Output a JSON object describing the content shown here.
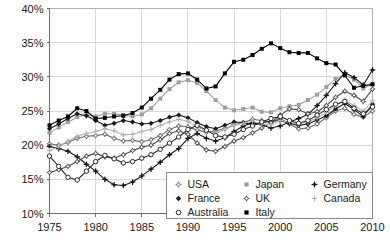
{
  "chart_data": {
    "type": "line",
    "title": "",
    "xlabel": "",
    "ylabel": "",
    "xlim": [
      1975,
      2010
    ],
    "ylim": [
      10,
      40
    ],
    "grid": true,
    "legend_position": "bottom-right",
    "x_ticks": [
      "1975",
      "1980",
      "1985",
      "1990",
      "1995",
      "2000",
      "2005",
      "2010"
    ],
    "x_tick_values": [
      1975,
      1980,
      1985,
      1990,
      1995,
      2000,
      2005,
      2010
    ],
    "y_ticks": [
      "10%",
      "15%",
      "20%",
      "25%",
      "30%",
      "35%",
      "40%"
    ],
    "y_tick_values": [
      10,
      15,
      20,
      25,
      30,
      35,
      40
    ],
    "x": [
      1975,
      1976,
      1977,
      1978,
      1979,
      1980,
      1981,
      1982,
      1983,
      1984,
      1985,
      1986,
      1987,
      1988,
      1989,
      1990,
      1991,
      1992,
      1993,
      1994,
      1995,
      1996,
      1997,
      1998,
      1999,
      2000,
      2001,
      2002,
      2003,
      2004,
      2005,
      2006,
      2007,
      2008,
      2009,
      2010
    ],
    "series": [
      {
        "name": "USA",
        "color": "#6b6b6b",
        "marker": "open-star",
        "values": [
          20.2,
          20.0,
          20.4,
          21.0,
          21.3,
          21.4,
          21.6,
          21.0,
          20.6,
          20.7,
          20.5,
          20.8,
          21.4,
          22.3,
          22.8,
          22.7,
          22.2,
          21.9,
          22.1,
          22.4,
          23.0,
          23.3,
          23.8,
          23.6,
          23.4,
          23.9,
          23.1,
          22.4,
          22.5,
          23.1,
          24.0,
          25.0,
          25.4,
          24.5,
          24.1,
          25.0
        ]
      },
      {
        "name": "Japan",
        "color": "#9e9e9e",
        "marker": "filled-square",
        "values": [
          21.8,
          22.6,
          23.4,
          24.1,
          24.5,
          24.2,
          24.6,
          24.6,
          24.4,
          24.2,
          24.5,
          25.4,
          26.8,
          28.2,
          29.2,
          29.5,
          29.1,
          27.9,
          26.6,
          25.5,
          25.1,
          25.3,
          25.5,
          24.9,
          24.8,
          25.4,
          25.7,
          25.9,
          26.6,
          27.4,
          28.5,
          29.7,
          30.3,
          29.6,
          28.3,
          29.0
        ]
      },
      {
        "name": "Germany",
        "color": "#1a1a1a",
        "marker": "filled-star",
        "values": [
          19.8,
          19.5,
          19.1,
          18.3,
          17.2,
          16.2,
          15.0,
          14.2,
          14.1,
          14.6,
          15.5,
          16.5,
          17.5,
          18.6,
          19.5,
          21.0,
          21.7,
          21.0,
          20.6,
          21.1,
          22.0,
          22.8,
          23.3,
          23.0,
          22.5,
          22.8,
          23.4,
          23.9,
          24.5,
          25.8,
          27.3,
          29.0,
          30.6,
          29.9,
          28.8,
          31.0
        ]
      },
      {
        "name": "France",
        "color": "#1a1a1a",
        "marker": "filled-diamond",
        "values": [
          22.4,
          23.1,
          23.9,
          24.6,
          24.3,
          23.6,
          22.9,
          23.2,
          23.6,
          23.4,
          23.1,
          23.2,
          23.6,
          24.1,
          24.4,
          24.0,
          23.3,
          22.7,
          22.4,
          22.9,
          23.4,
          23.3,
          23.0,
          23.3,
          23.5,
          23.6,
          23.2,
          22.9,
          23.1,
          23.7,
          24.3,
          25.3,
          26.1,
          25.2,
          24.2,
          26.0
        ]
      },
      {
        "name": "UK",
        "color": "#4d4d4d",
        "marker": "open-star",
        "values": [
          16.0,
          16.4,
          16.9,
          17.6,
          18.4,
          18.8,
          18.3,
          18.1,
          18.6,
          19.2,
          19.7,
          20.0,
          20.8,
          21.7,
          22.1,
          21.6,
          20.3,
          19.3,
          19.1,
          19.8,
          20.6,
          21.1,
          21.8,
          22.5,
          23.3,
          24.4,
          25.3,
          25.2,
          24.6,
          24.9,
          25.8,
          27.0,
          27.9,
          27.3,
          26.4,
          28.2
        ]
      },
      {
        "name": "Canada",
        "color": "#b3b3b3",
        "marker": "light-star",
        "values": [
          19.2,
          19.8,
          20.6,
          21.3,
          21.7,
          22.0,
          22.4,
          22.1,
          21.5,
          21.6,
          22.0,
          22.3,
          22.9,
          23.4,
          23.8,
          23.5,
          22.7,
          22.0,
          21.8,
          22.3,
          22.9,
          23.2,
          23.5,
          23.1,
          23.0,
          23.6,
          23.4,
          23.1,
          23.4,
          24.0,
          24.8,
          25.8,
          26.6,
          25.8,
          25.0,
          26.5
        ]
      },
      {
        "name": "Australia",
        "color": "#2b2b2b",
        "marker": "open-circle",
        "values": [
          18.4,
          16.9,
          15.3,
          14.9,
          16.2,
          17.6,
          18.5,
          18.0,
          17.4,
          17.6,
          18.1,
          18.6,
          19.4,
          20.3,
          21.2,
          22.3,
          22.9,
          22.2,
          21.4,
          21.2,
          21.6,
          22.3,
          22.8,
          23.4,
          23.9,
          24.2,
          23.6,
          23.2,
          23.6,
          24.4,
          25.2,
          26.0,
          26.4,
          25.4,
          24.6,
          25.6
        ]
      },
      {
        "name": "Italy",
        "color": "#000000",
        "marker": "filled-square",
        "values": [
          22.9,
          23.6,
          24.2,
          25.4,
          25.0,
          23.9,
          24.0,
          24.2,
          24.3,
          24.7,
          25.5,
          26.8,
          28.1,
          29.6,
          30.4,
          30.5,
          29.6,
          28.3,
          28.6,
          30.5,
          32.2,
          32.5,
          33.2,
          34.1,
          34.9,
          34.2,
          33.6,
          33.5,
          33.5,
          32.7,
          32.0,
          31.8,
          30.2,
          28.4,
          28.7,
          28.9
        ]
      }
    ]
  },
  "legend": {
    "entries": [
      {
        "label": "USA"
      },
      {
        "label": "Japan"
      },
      {
        "label": "Germany"
      },
      {
        "label": "France"
      },
      {
        "label": "UK"
      },
      {
        "label": "Canada"
      },
      {
        "label": "Australia"
      },
      {
        "label": "Italy"
      }
    ]
  }
}
